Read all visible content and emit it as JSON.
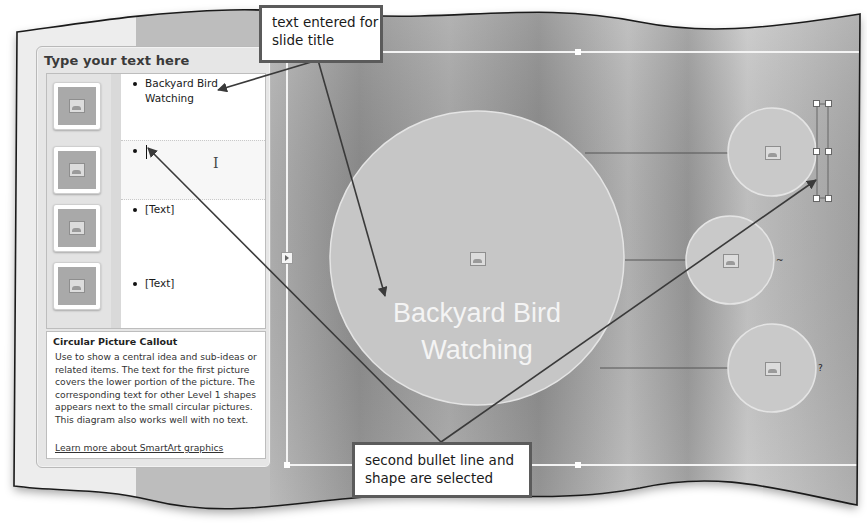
{
  "text_pane": {
    "title": "Type your text here",
    "entries": [
      {
        "text": "Backyard Bird Watching",
        "thumbnail_icon": "picture-placeholder-icon",
        "selected": false
      },
      {
        "text": "",
        "thumbnail_icon": "picture-placeholder-icon",
        "selected": true,
        "has_caret": true
      },
      {
        "text": "[Text]",
        "thumbnail_icon": "picture-placeholder-icon",
        "selected": false
      },
      {
        "text": "[Text]",
        "thumbnail_icon": "picture-placeholder-icon",
        "selected": false
      }
    ],
    "description": {
      "title": "Circular Picture Callout",
      "body": "Use to show a central idea and sub-ideas or related items. The text for the first picture covers the lower portion of the picture. The corresponding text for other Level 1 shapes appears next to the small circular pictures. This diagram also works well with no text.",
      "link": "Learn more about SmartArt graphics"
    }
  },
  "slide": {
    "main_circle_text": "Backyard Bird Watching",
    "small_circles": 3,
    "selected_shape": "text box next to first small circle"
  },
  "callouts": {
    "top": "text entered for slide title",
    "bottom": "second bullet line and shape are selected"
  },
  "icons": {
    "pane_toggle": "chevron-right-icon",
    "picture": "picture-placeholder-icon",
    "ibeam": "I"
  },
  "colors": {
    "frame_border": "#1a1a1a",
    "callout_border": "#5b5b5b",
    "circle_fill": "#c4c4c4",
    "arrow": "#3a3a3a"
  }
}
